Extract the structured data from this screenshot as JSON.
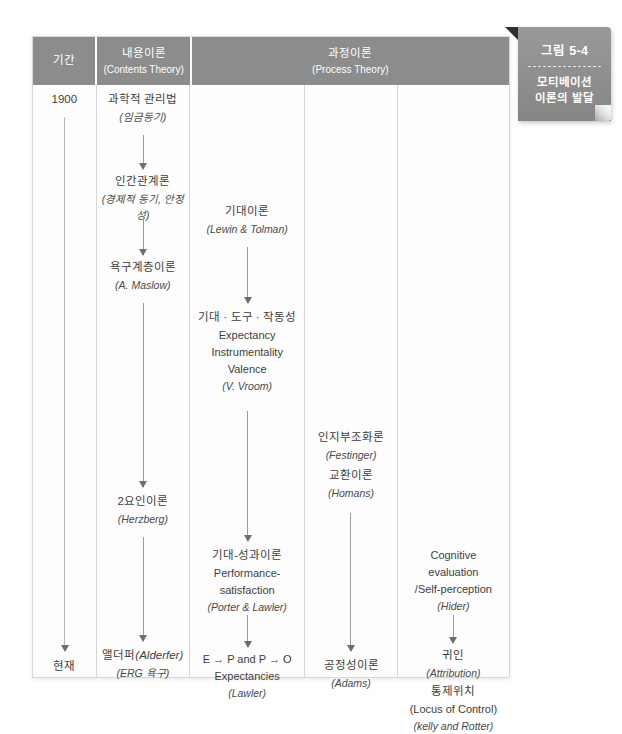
{
  "figure_tab": {
    "number": "그림 5-4",
    "title_line1": "모티베이션",
    "title_line2": "이론의 발달"
  },
  "header": {
    "period": {
      "ko": "기간",
      "en": ""
    },
    "contents_theory": {
      "ko": "내용이론",
      "en": "(Contents Theory)"
    },
    "process_theory": {
      "ko": "과정이론",
      "en": "(Process Theory)"
    }
  },
  "timeline": {
    "start": "1900",
    "end": "현재"
  },
  "columns": {
    "contents": [
      {
        "ko": "과학적 관리법",
        "en": "",
        "it": "(임금동기)"
      },
      {
        "ko": "인간관계론",
        "en": "",
        "it": "(경제적 동기, 안정성)"
      },
      {
        "ko": "욕구계층이론",
        "en": "",
        "it": "(A. Maslow)"
      },
      {
        "ko": "2요인이론",
        "en": "",
        "it": "(Herzberg)"
      },
      {
        "ko": "앨더퍼(Alderfer)",
        "en": "",
        "it": "(ERG 욕구)"
      }
    ],
    "process_1": [
      {
        "ko": "기대이론",
        "en": "",
        "it": "(Lewin & Tolman)"
      },
      {
        "ko": "기대 · 도구 · 작동성",
        "en": "Expectancy\nInstrumentality\nValence",
        "it": "(V. Vroom)"
      },
      {
        "ko": "기대-성과이론",
        "en": "Performance-\nsatisfaction",
        "it": "(Porter & Lawler)"
      },
      {
        "ko": "",
        "en": "E → P and P → O\nExpectancies",
        "it": "(Lawler)"
      }
    ],
    "process_2": [
      {
        "ko": "인지부조화론",
        "en": "",
        "it": "(Festinger)"
      },
      {
        "ko": "교환이론",
        "en": "",
        "it": "(Homans)"
      },
      {
        "ko": "공정성이론",
        "en": "",
        "it": "(Adams)"
      }
    ],
    "process_3": [
      {
        "ko": "",
        "en": "Cognitive\nevaluation\n/Self-perception",
        "it": "(Hider)"
      },
      {
        "ko": "귀인",
        "en": "",
        "it": "(Attribution)"
      },
      {
        "ko": "통제위치",
        "en": "(Locus of Control)",
        "it": "(kelly and Rotter)"
      }
    ]
  },
  "colors": {
    "header_band": "#8c8c8c",
    "tab": "#8e8e8e",
    "frame_border": "#d9d9d9",
    "divider": "#d6d6d6",
    "arrow": "#9c9c9c",
    "text": "#3d3d3d",
    "page_background": "#ffffff"
  }
}
